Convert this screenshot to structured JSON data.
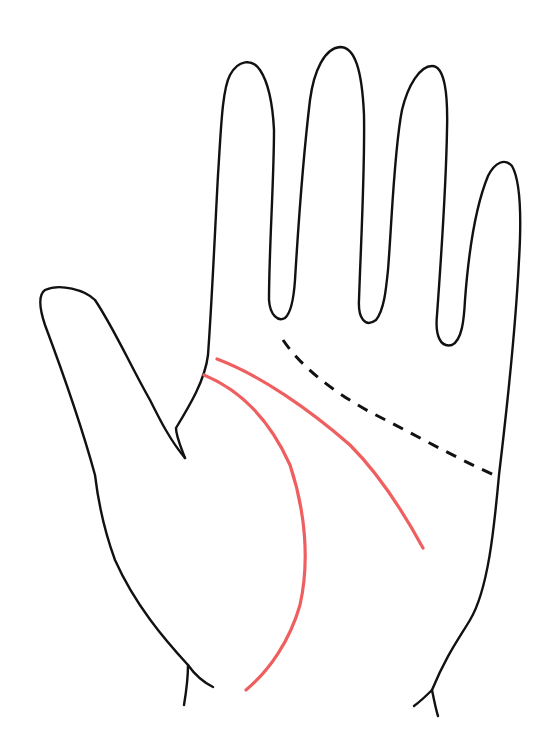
{
  "diagram": {
    "colors": {
      "background": "#ffffff",
      "outline": "#111111",
      "highlight_line": "#ef5f5f",
      "dashed_line": "#111111"
    },
    "elements": [
      {
        "name": "hand-outline",
        "style": "solid black"
      },
      {
        "name": "head-line",
        "style": "solid red"
      },
      {
        "name": "life-line",
        "style": "solid red"
      },
      {
        "name": "heart-line",
        "style": "dashed black"
      }
    ]
  }
}
